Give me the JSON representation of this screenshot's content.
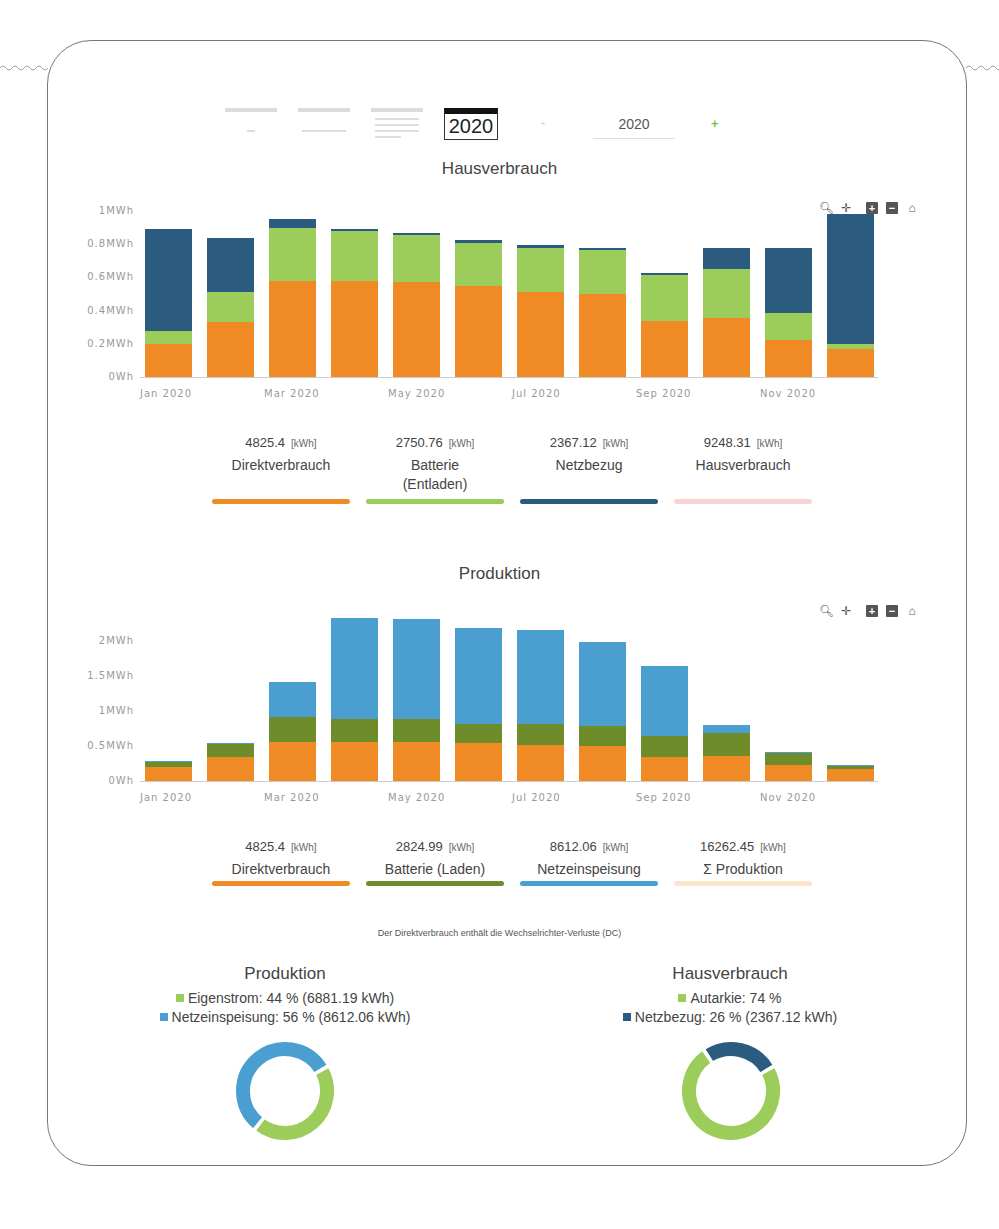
{
  "toolbar": {
    "views": [
      "day-view",
      "month-view",
      "calendar-view"
    ],
    "year_button": "2020",
    "minus_label": "-",
    "year_input_value": "2020",
    "plus_label": "+"
  },
  "chart_tools": [
    "zoom-icon",
    "pan-icon",
    "zoom-in-icon",
    "zoom-out-icon",
    "home-icon"
  ],
  "hausverbrauch": {
    "title": "Hausverbrauch",
    "stats": [
      {
        "value": "4825.4",
        "unit": "[kWh]",
        "label": "Direktverbrauch",
        "color": "#f08a24"
      },
      {
        "value": "2750.76",
        "unit": "[kWh]",
        "label": "Batterie (Entladen)",
        "color": "#9ccc5a"
      },
      {
        "value": "2367.12",
        "unit": "[kWh]",
        "label": "Netzbezug",
        "color": "#2b5b7e"
      },
      {
        "value": "9248.31",
        "unit": "[kWh]",
        "label": "Hausverbrauch",
        "color": "#f9d3d3"
      }
    ]
  },
  "produktion": {
    "title": "Produktion",
    "stats": [
      {
        "value": "4825.4",
        "unit": "[kWh]",
        "label": "Direktverbrauch",
        "color": "#f08a24"
      },
      {
        "value": "2824.99",
        "unit": "[kWh]",
        "label": "Batterie (Laden)",
        "color": "#6e8d2a"
      },
      {
        "value": "8612.06",
        "unit": "[kWh]",
        "label": "Netzeinspeisung",
        "color": "#4b9fd0"
      },
      {
        "value": "16262.45",
        "unit": "[kWh]",
        "label": "Σ Produktion",
        "color": "#fbe6cc"
      }
    ]
  },
  "note": "Der Direktverbrauch enthält die Wechselrichter-Verluste (DC)",
  "pie_produktion": {
    "title": "Produktion",
    "legend": [
      {
        "label": "Eigenstrom: 44 % (6881.19 kWh)",
        "color": "#9ccc5a"
      },
      {
        "label": "Netzeinspeisung: 56 % (8612.06 kWh)",
        "color": "#4b9fd0"
      }
    ]
  },
  "pie_hausverbrauch": {
    "title": "Hausverbrauch",
    "legend": [
      {
        "label": "Autarkie: 74 %",
        "color": "#9ccc5a"
      },
      {
        "label": "Netzbezug: 26 % (2367.12 kWh)",
        "color": "#2b5b7e"
      }
    ]
  },
  "chart_data": [
    {
      "type": "bar",
      "stacked": true,
      "title": "Hausverbrauch",
      "categories": [
        "Jan 2020",
        "Feb 2020",
        "Mar 2020",
        "Apr 2020",
        "May 2020",
        "Jun 2020",
        "Jul 2020",
        "Aug 2020",
        "Sep 2020",
        "Oct 2020",
        "Nov 2020",
        "Dec 2020"
      ],
      "xtick_labels": [
        "Jan 2020",
        "Mar 2020",
        "May 2020",
        "Jul 2020",
        "Sep 2020",
        "Nov 2020"
      ],
      "ytick_labels": [
        "0Wh",
        "0.2MWh",
        "0.4MWh",
        "0.6MWh",
        "0.8MWh",
        "1MWh"
      ],
      "ylabel": "MWh",
      "ylim": [
        0,
        1
      ],
      "series": [
        {
          "name": "Direktverbrauch",
          "color": "#f08a24",
          "values": [
            0.2,
            0.33,
            0.58,
            0.58,
            0.57,
            0.55,
            0.51,
            0.5,
            0.34,
            0.355,
            0.225,
            0.17
          ]
        },
        {
          "name": "Batterie (Entladen)",
          "color": "#9ccc5a",
          "values": [
            0.08,
            0.18,
            0.32,
            0.3,
            0.285,
            0.26,
            0.27,
            0.265,
            0.275,
            0.295,
            0.16,
            0.03
          ]
        },
        {
          "name": "Netzbezug",
          "color": "#2b5b7e",
          "values": [
            0.61,
            0.33,
            0.05,
            0.01,
            0.01,
            0.015,
            0.015,
            0.012,
            0.012,
            0.13,
            0.395,
            0.78
          ]
        }
      ]
    },
    {
      "type": "bar",
      "stacked": true,
      "title": "Produktion",
      "categories": [
        "Jan 2020",
        "Feb 2020",
        "Mar 2020",
        "Apr 2020",
        "May 2020",
        "Jun 2020",
        "Jul 2020",
        "Aug 2020",
        "Sep 2020",
        "Oct 2020",
        "Nov 2020",
        "Dec 2020"
      ],
      "xtick_labels": [
        "Jan 2020",
        "Mar 2020",
        "May 2020",
        "Jul 2020",
        "Sep 2020",
        "Nov 2020"
      ],
      "ytick_labels": [
        "0Wh",
        "0.5MWh",
        "1MWh",
        "1.5MWh",
        "2MWh"
      ],
      "ylabel": "MWh",
      "ylim": [
        0,
        2.4
      ],
      "series": [
        {
          "name": "Direktverbrauch",
          "color": "#f08a24",
          "values": [
            0.2,
            0.34,
            0.56,
            0.56,
            0.55,
            0.54,
            0.51,
            0.5,
            0.34,
            0.36,
            0.23,
            0.17
          ]
        },
        {
          "name": "Batterie (Laden)",
          "color": "#6e8d2a",
          "values": [
            0.08,
            0.19,
            0.36,
            0.33,
            0.33,
            0.28,
            0.3,
            0.29,
            0.3,
            0.32,
            0.18,
            0.04
          ]
        },
        {
          "name": "Netzeinspeisung",
          "color": "#4b9fd0",
          "values": [
            0.01,
            0.01,
            0.5,
            1.44,
            1.44,
            1.37,
            1.35,
            1.2,
            1.01,
            0.12,
            0.01,
            0.02
          ]
        }
      ]
    },
    {
      "type": "pie",
      "title": "Produktion",
      "labels": [
        "Eigenstrom",
        "Netzeinspeisung"
      ],
      "values": [
        44,
        56
      ],
      "kwh": [
        6881.19,
        8612.06
      ],
      "colors": [
        "#9ccc5a",
        "#4b9fd0"
      ]
    },
    {
      "type": "pie",
      "title": "Hausverbrauch",
      "labels": [
        "Autarkie",
        "Netzbezug"
      ],
      "values": [
        74,
        26
      ],
      "kwh": [
        null,
        2367.12
      ],
      "colors": [
        "#9ccc5a",
        "#2b5b7e"
      ]
    }
  ]
}
